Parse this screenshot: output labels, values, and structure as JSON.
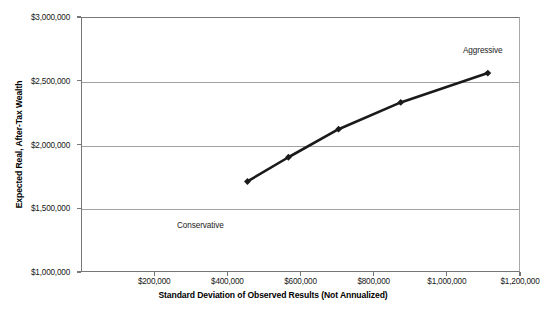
{
  "chart_data": {
    "type": "line",
    "title": "",
    "xlabel": "Standard Deviation of Observed Results (Not Annualized)",
    "ylabel": "Expected Real, After-Tax Wealth",
    "xlim": [
      0,
      1200000
    ],
    "ylim": [
      1000000,
      3000000
    ],
    "grid": true,
    "legend": "none",
    "marker": "diamond",
    "line_color": "#1a1a1a",
    "grid_color": "#a2a2a2",
    "axis_color": "#767676",
    "background": "#ffffff",
    "x_ticks": [
      200000,
      400000,
      600000,
      800000,
      1000000,
      1200000
    ],
    "x_tick_labels": [
      "$200,000",
      "$400,000",
      "$600,000",
      "$800,000",
      "$1,000,000",
      "$1,200,000"
    ],
    "y_ticks": [
      1000000,
      1500000,
      2000000,
      2500000,
      3000000
    ],
    "y_tick_labels": [
      "$1,000,000",
      "$1,500,000",
      "$2,000,000",
      "$2,500,000",
      "$3,000,000"
    ],
    "series": [
      {
        "name": "Efficient Frontier",
        "x": [
          455000,
          567000,
          704000,
          874000,
          1112000
        ],
        "y": [
          1710000,
          1900000,
          2120000,
          2330000,
          2560000
        ]
      }
    ],
    "annotations": [
      {
        "text": "Aggressive",
        "x_px": 463,
        "y_px": 46
      },
      {
        "text": "Conservative",
        "x_px": 177,
        "y_px": 221
      }
    ]
  }
}
